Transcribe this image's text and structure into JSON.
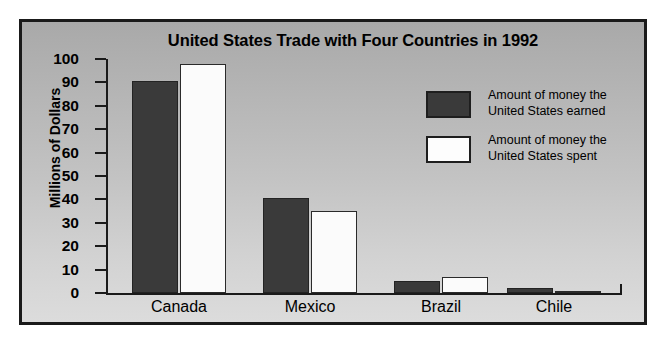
{
  "chart_data": {
    "type": "bar",
    "title": "United States Trade with Four Countries in 1992",
    "xlabel": "",
    "ylabel": "Millions of Dollars",
    "categories": [
      "Canada",
      "Mexico",
      "Brazil",
      "Chile"
    ],
    "series": [
      {
        "name": "Amount of money the United States earned",
        "color": "#3a3a3a",
        "values": [
          90.5,
          40.5,
          5,
          2
        ]
      },
      {
        "name": "Amount of money the United States spent",
        "color": "#ffffff",
        "values": [
          98,
          35,
          7,
          1
        ]
      }
    ],
    "ylim": [
      0,
      100
    ],
    "yticks": [
      0,
      10,
      20,
      30,
      40,
      50,
      60,
      70,
      80,
      90,
      100
    ],
    "ytick_labels": [
      "0",
      "10",
      "20",
      "30",
      "40",
      "50",
      "60",
      "70",
      "80",
      "90",
      "100"
    ],
    "grid": false,
    "legend_position": "upper right"
  },
  "legend": {
    "entries": [
      {
        "line1": "Amount of money the",
        "line2": "United States earned",
        "swatch": "earned"
      },
      {
        "line1": "Amount of money the",
        "line2": "United States spent",
        "swatch": "spent"
      }
    ]
  }
}
